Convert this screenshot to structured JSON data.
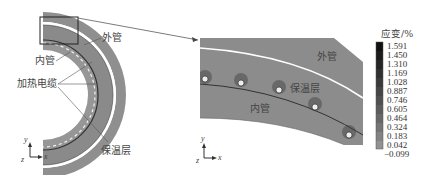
{
  "figure": {
    "left_panel": {
      "labels": {
        "outer_pipe": "外管",
        "inner_pipe": "内管",
        "heating_cable": "加热电缆",
        "insulation_layer": "保温层"
      },
      "axes": {
        "y": "y",
        "x": "x",
        "z": "z"
      }
    },
    "right_panel": {
      "labels": {
        "outer_pipe": "外管",
        "insulation_layer": "保温层",
        "inner_pipe": "内管"
      },
      "axes": {
        "y": "y",
        "x": "x",
        "z": "z"
      }
    },
    "colorbar": {
      "title": "应变/%",
      "ticks": [
        "1.591",
        "1.450",
        "1.310",
        "1.169",
        "1.028",
        "0.887",
        "0.746",
        "0.605",
        "0.464",
        "0.324",
        "0.183",
        "0.042",
        "−0.099"
      ],
      "colors": [
        "#111111",
        "#1c1c1c",
        "#262626",
        "#303030",
        "#3a3a3a",
        "#454545",
        "#505050",
        "#5c5c5c",
        "#686868",
        "#757575",
        "#838383",
        "#929292"
      ]
    },
    "colors": {
      "pipe_gray": "#8c8c8c",
      "pipe_dark_line": "#333333",
      "highlight_box": "#222222"
    }
  }
}
